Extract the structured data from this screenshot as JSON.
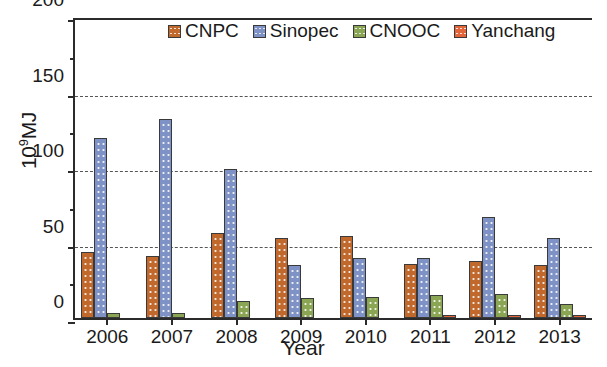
{
  "chart_data": {
    "type": "bar",
    "title": "",
    "xlabel": "Year",
    "ylabel": "10⁹MJ",
    "ylabel_base": "10",
    "ylabel_exp": "9",
    "ylabel_unit": "MJ",
    "categories": [
      "2006",
      "2007",
      "2008",
      "2009",
      "2010",
      "2011",
      "2012",
      "2013"
    ],
    "ylim": [
      0,
      200
    ],
    "yticks": [
      0,
      50,
      100,
      150,
      200
    ],
    "ytick_labels": [
      "0",
      "50",
      "100",
      "150",
      "200"
    ],
    "grid": "horizontal-dashed",
    "legend_position": "top-center",
    "series": [
      {
        "name": "CNPC",
        "color": "#c1682c",
        "values": [
          44,
          41,
          56,
          53,
          54,
          36,
          38,
          35
        ]
      },
      {
        "name": "Sinopec",
        "color": "#7f92c6",
        "values": [
          119,
          132,
          99,
          35,
          40,
          40,
          67,
          53
        ]
      },
      {
        "name": "CNOOC",
        "color": "#8aa553",
        "values": [
          3,
          3,
          11,
          13,
          14,
          15,
          16,
          9
        ]
      },
      {
        "name": "Yanchang",
        "color": "#e2663a",
        "values": [
          0,
          0,
          0,
          0,
          0,
          2,
          2,
          2
        ]
      }
    ]
  },
  "colors": {
    "axis": "#2b2b2b",
    "grid": "#555555",
    "background": "#ffffff",
    "cnpc": "#c1682c",
    "sinopec": "#7f92c6",
    "cnooc": "#8aa553",
    "yanchang": "#e2663a"
  }
}
